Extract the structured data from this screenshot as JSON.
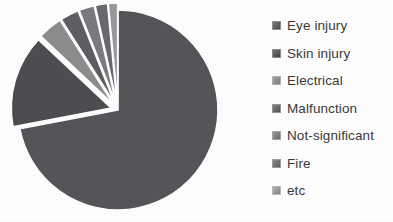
{
  "chart_data": {
    "type": "pie",
    "title": "",
    "subtitle": "",
    "xlabel": "",
    "ylabel": "",
    "grid": false,
    "legend_position": "right",
    "exploded": true,
    "style": "greyscale",
    "categories": [
      "Eye injury",
      "Skin injury",
      "Electrical",
      "Malfunction",
      "Not-significant",
      "Fire",
      "etc"
    ],
    "values": [
      72,
      15,
      4,
      3,
      2.5,
      2,
      1.5
    ],
    "unit": "%",
    "colors": [
      "#56565a",
      "#4e4e52",
      "#8d8d90",
      "#5f5f63",
      "#7b7b7f",
      "#6a6a6e",
      "#9a9a9d"
    ],
    "slices": [
      {
        "label": "Eye injury",
        "value": 72,
        "color": "#56565a",
        "exploded": false
      },
      {
        "label": "Skin injury",
        "value": 15,
        "color": "#4e4e52",
        "exploded": true
      },
      {
        "label": "Electrical",
        "value": 4,
        "color": "#8d8d90",
        "exploded": true
      },
      {
        "label": "Malfunction",
        "value": 3,
        "color": "#5f5f63",
        "exploded": true
      },
      {
        "label": "Not-significant",
        "value": 2.5,
        "color": "#7b7b7f",
        "exploded": true
      },
      {
        "label": "Fire",
        "value": 2,
        "color": "#6a6a6e",
        "exploded": true
      },
      {
        "label": "etc",
        "value": 1.5,
        "color": "#9a9a9d",
        "exploded": true
      }
    ]
  },
  "legend": {
    "items": [
      {
        "label": "Eye injury",
        "color": "#56565a"
      },
      {
        "label": "Skin injury",
        "color": "#4e4e52"
      },
      {
        "label": "Electrical",
        "color": "#8d8d90"
      },
      {
        "label": "Malfunction",
        "color": "#5f5f63"
      },
      {
        "label": "Not-significant",
        "color": "#7b7b7f"
      },
      {
        "label": "Fire",
        "color": "#6a6a6e"
      },
      {
        "label": "etc",
        "color": "#9a9a9d"
      }
    ]
  },
  "geometry": {
    "center_x": 118,
    "center_y": 110,
    "radius": 100,
    "start_angle_deg": -90,
    "explode_offset": 7
  }
}
